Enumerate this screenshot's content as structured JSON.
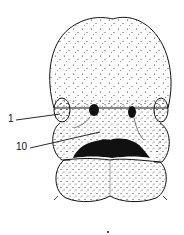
{
  "figure": {
    "type": "embryo-face-line-drawing",
    "labels": [
      {
        "id": "1",
        "text": "1",
        "points_to": "maxillary-prominence-left"
      },
      {
        "id": "10",
        "text": "10",
        "points_to": "nasolacrimal-groove"
      }
    ],
    "colors": {
      "ink": "#111111",
      "background": "#ffffff"
    }
  }
}
